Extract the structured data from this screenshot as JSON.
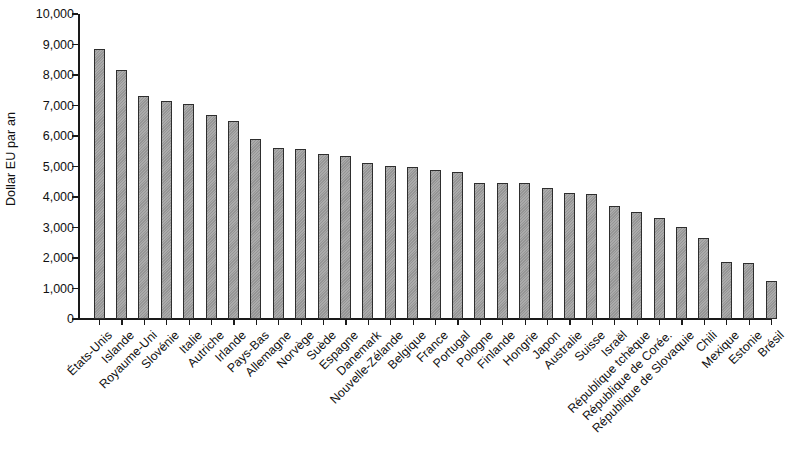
{
  "chart_data": {
    "type": "bar",
    "title": "",
    "subtitle": "",
    "xlabel": "",
    "ylabel": "Dollar EU par an",
    "ylim": [
      0,
      10000
    ],
    "ytick_labels": [
      "0",
      "1,000",
      "2,000",
      "3,000",
      "4,000",
      "5,000",
      "6,000",
      "7,000",
      "8,000",
      "9,000",
      "10,000"
    ],
    "ytick_values": [
      0,
      1000,
      2000,
      3000,
      4000,
      5000,
      6000,
      7000,
      8000,
      9000,
      10000
    ],
    "grid": false,
    "legend": null,
    "bar_color": "#9d9d9d",
    "bar_border_color": "#2e2e2e",
    "axis_color": "#1a1a1a",
    "categories": [
      "États-Unis",
      "Islande",
      "Royaume-Uni",
      "Slovénie",
      "Italie",
      "Autriche",
      "Irlande",
      "Pays-Bas",
      "Allemagne",
      "Norvège",
      "Suède",
      "Espagne",
      "Danemark",
      "Nouvelle-Zélande",
      "Belgique",
      "France",
      "Portugal",
      "Pologne",
      "Finlande",
      "Hongrie",
      "Japon",
      "Australie",
      "Suisse",
      "Israël",
      "République tchèque",
      "République de Corée.",
      "République de Slovaquie",
      "Chili",
      "Mexique",
      "Estonie",
      "Brésil"
    ],
    "values": [
      8850,
      8150,
      7300,
      7150,
      7050,
      6700,
      6500,
      5900,
      5600,
      5580,
      5400,
      5330,
      5130,
      5030,
      5000,
      4880,
      4830,
      4470,
      4450,
      4450,
      4300,
      4120,
      4100,
      3700,
      3500,
      3300,
      3030,
      2650,
      1860,
      1850,
      1250
    ]
  }
}
